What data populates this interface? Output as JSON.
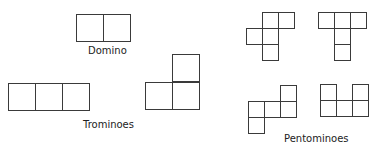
{
  "labels": {
    "domino": "Domino",
    "trominoes": "Trominoes",
    "pentominoes": "Pentominoes"
  },
  "colors": {
    "stroke": "#3a3a3a",
    "background": "#ffffff"
  },
  "shapes": [
    {
      "name": "domino",
      "cell": 27,
      "cells": [
        [
          76,
          14
        ],
        [
          103,
          14
        ]
      ]
    },
    {
      "name": "tromino-straight",
      "cell": 27,
      "cells": [
        [
          8,
          83
        ],
        [
          35,
          83
        ],
        [
          62,
          83
        ]
      ]
    },
    {
      "name": "tromino-l",
      "cell": 27,
      "cells": [
        [
          172,
          54
        ],
        [
          145,
          82
        ],
        [
          172,
          82
        ]
      ]
    },
    {
      "name": "pentomino-f",
      "cell": 16,
      "cells": [
        [
          262,
          12
        ],
        [
          278,
          12
        ],
        [
          246,
          28
        ],
        [
          262,
          28
        ],
        [
          262,
          44
        ]
      ]
    },
    {
      "name": "pentomino-t",
      "cell": 16,
      "cells": [
        [
          318,
          12
        ],
        [
          334,
          12
        ],
        [
          350,
          12
        ],
        [
          334,
          28
        ],
        [
          334,
          44
        ]
      ]
    },
    {
      "name": "pentomino-n",
      "cell": 16,
      "cells": [
        [
          280,
          85
        ],
        [
          248,
          101
        ],
        [
          264,
          101
        ],
        [
          280,
          101
        ],
        [
          248,
          117
        ]
      ]
    },
    {
      "name": "pentomino-u",
      "cell": 16,
      "cells": [
        [
          320,
          84
        ],
        [
          352,
          84
        ],
        [
          320,
          100
        ],
        [
          336,
          100
        ],
        [
          352,
          100
        ]
      ]
    }
  ]
}
